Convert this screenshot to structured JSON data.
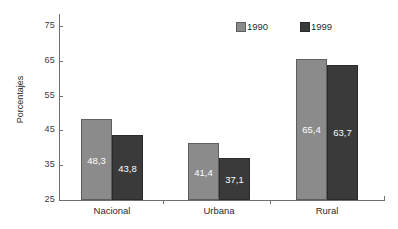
{
  "chart_data": {
    "type": "bar",
    "title": "",
    "subtitle": "",
    "xlabel": "",
    "ylabel": "Porcentajes",
    "categories": [
      "Nacional",
      "Urbana",
      "Rural"
    ],
    "series": [
      {
        "name": "1990",
        "color": "#8b8b8b",
        "values": [
          48.3,
          41.4,
          65.4
        ],
        "labels": [
          "48,3",
          "41,4",
          "65,4"
        ]
      },
      {
        "name": "1999",
        "color": "#3a3a3a",
        "values": [
          43.8,
          37.1,
          63.7
        ],
        "labels": [
          "43,8",
          "37,1",
          "63,7"
        ]
      }
    ],
    "ylim": [
      25,
      75
    ],
    "yticks": [
      25,
      35,
      45,
      55,
      65,
      75
    ],
    "ytick_labels": [
      "25",
      "35",
      "45",
      "55",
      "65",
      "75"
    ],
    "grid": false,
    "legend_position": "top-right",
    "value_labels_inside_bars": true,
    "decimal_separator": ","
  },
  "legend": {
    "items": [
      {
        "label": "1990",
        "swatch": "legend-swatch-1990"
      },
      {
        "label": "1999",
        "swatch": "legend-swatch-1999"
      }
    ]
  },
  "axis": {
    "y_title": "Porcentajes"
  },
  "colors": {
    "series_1990": "#8b8b8b",
    "series_1999": "#3a3a3a",
    "axis": "#6f6f6f",
    "background": "#ffffff",
    "value_label": "#ffffff"
  }
}
